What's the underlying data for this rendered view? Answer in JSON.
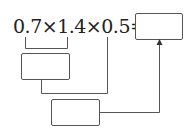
{
  "expression": {
    "text": "0.7×1.4×0.5=",
    "terms": [
      "0.7",
      "1.4",
      "0.5"
    ],
    "operator": "×",
    "equals": "="
  },
  "boxes": {
    "answer": "",
    "step1": "",
    "step2": ""
  },
  "colors": {
    "line": "#555555",
    "text": "#222222"
  }
}
